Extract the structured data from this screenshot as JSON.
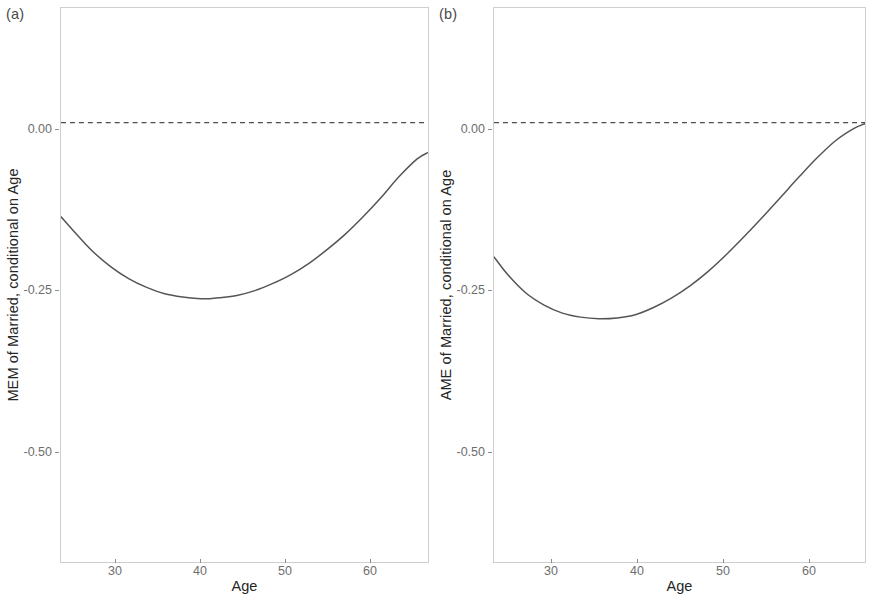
{
  "figure": {
    "background_color": "#ffffff",
    "panel_border_color": "#cfcfcf",
    "curve_color": "#555555",
    "zero_line_color": "#4d4d4d",
    "tick_label_color": "#6e6e6e",
    "axis_title_color": "#262626"
  },
  "panels": [
    {
      "tag": "(a)",
      "xlabel": "Age",
      "ylabel": "MEM of Married, conditional on Age",
      "ytick_labels": [
        "0.00",
        "-0.25",
        "-0.50"
      ],
      "xtick_labels": [
        "30",
        "40",
        "50",
        "60"
      ]
    },
    {
      "tag": "(b)",
      "xlabel": "Age",
      "ylabel": "AME of Married, conditional on Age",
      "ytick_labels": [
        "0.00",
        "-0.25",
        "-0.50"
      ],
      "xtick_labels": [
        "30",
        "40",
        "50",
        "60"
      ]
    }
  ],
  "chart_data": [
    {
      "type": "line",
      "title": "(a)",
      "xlabel": "Age",
      "ylabel": "MEM of Married, conditional on Age",
      "xlim": [
        24.5,
        65.2
      ],
      "ylim": [
        -0.62,
        0.07
      ],
      "xticks": [
        30,
        40,
        50,
        60
      ],
      "yticks": [
        0.0,
        -0.25,
        -0.5
      ],
      "grid": false,
      "legend": "none",
      "annotations": [
        {
          "type": "hline",
          "y": 0.0,
          "style": "dashed",
          "label": "zero reference line"
        }
      ],
      "series": [
        {
          "name": "MEM of Married",
          "x": [
            24.5,
            26,
            28,
            30,
            32,
            34,
            36,
            38,
            40,
            41,
            42,
            44,
            46,
            48,
            50,
            52,
            54,
            56,
            58,
            60,
            62,
            64,
            65.2
          ],
          "y": [
            -0.19,
            -0.209,
            -0.233,
            -0.252,
            -0.267,
            -0.278,
            -0.286,
            -0.29,
            -0.292,
            -0.292,
            -0.291,
            -0.288,
            -0.282,
            -0.273,
            -0.262,
            -0.248,
            -0.231,
            -0.212,
            -0.19,
            -0.166,
            -0.14,
            -0.118,
            -0.11
          ]
        }
      ]
    },
    {
      "type": "line",
      "title": "(b)",
      "xlabel": "Age",
      "ylabel": "AME of Married, conditional on Age",
      "xlim": [
        24.5,
        65.2
      ],
      "ylim": [
        -0.62,
        0.07
      ],
      "xticks": [
        30,
        40,
        50,
        60
      ],
      "yticks": [
        0.0,
        -0.25,
        -0.5
      ],
      "grid": false,
      "legend": "none",
      "annotations": [
        {
          "type": "hline",
          "y": 0.0,
          "style": "dashed",
          "label": "zero reference line"
        }
      ],
      "series": [
        {
          "name": "AME of Married",
          "x": [
            24.5,
            26,
            28,
            30,
            32,
            34,
            36,
            38,
            40,
            42,
            44,
            46,
            48,
            50,
            52,
            54,
            56,
            58,
            60,
            62,
            64,
            65.2
          ],
          "y": [
            -0.24,
            -0.262,
            -0.285,
            -0.3,
            -0.31,
            -0.315,
            -0.317,
            -0.316,
            -0.312,
            -0.303,
            -0.291,
            -0.276,
            -0.258,
            -0.237,
            -0.214,
            -0.19,
            -0.165,
            -0.14,
            -0.116,
            -0.095,
            -0.08,
            -0.074
          ]
        }
      ]
    }
  ]
}
